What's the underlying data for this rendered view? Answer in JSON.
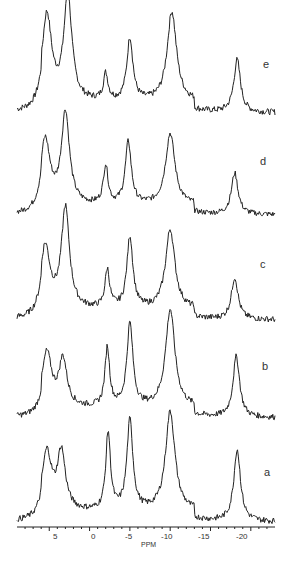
{
  "chart_data": {
    "type": "line",
    "title": "",
    "xlabel": "PPM",
    "ylabel": "",
    "xlim": [
      9,
      -23
    ],
    "x_reversed": true,
    "x_ticks": [
      5,
      0,
      -5,
      -10,
      -15,
      -20
    ],
    "x_tick_labels": [
      "5",
      "0",
      "-5",
      "-10",
      "-15",
      "-20"
    ],
    "grid": false,
    "legend": "none; traces labelled on right",
    "series": [
      {
        "name": "e",
        "peaks_ppm": [
          5.3,
          2.7,
          -2.0,
          -5.0,
          -10.2,
          -18.3
        ],
        "peak_rel_heights": [
          0.82,
          1.0,
          0.25,
          0.6,
          0.86,
          0.5
        ]
      },
      {
        "name": "d",
        "peaks_ppm": [
          5.5,
          3.0,
          -2.0,
          -4.8,
          -10.0,
          -18.0
        ],
        "peak_rel_heights": [
          0.7,
          1.0,
          0.42,
          0.68,
          0.78,
          0.45
        ]
      },
      {
        "name": "c",
        "peaks_ppm": [
          5.5,
          3.0,
          -2.2,
          -5.0,
          -10.0,
          -18.0
        ],
        "peak_rel_heights": [
          0.62,
          1.0,
          0.38,
          0.72,
          0.8,
          0.42
        ]
      },
      {
        "name": "b",
        "peaks_ppm": [
          5.3,
          3.3,
          -2.2,
          -5.0,
          -10.0,
          -18.2
        ],
        "peak_rel_heights": [
          0.55,
          0.48,
          0.6,
          0.85,
          1.0,
          0.62
        ]
      },
      {
        "name": "a",
        "peaks_ppm": [
          5.3,
          3.5,
          -2.3,
          -5.0,
          -10.0,
          -18.3
        ],
        "peak_rel_heights": [
          0.58,
          0.58,
          0.78,
          0.9,
          1.0,
          0.72
        ]
      }
    ]
  },
  "labels": {
    "e": "e",
    "d": "d",
    "c": "c",
    "b": "b",
    "a": "a",
    "axis": "PPM"
  },
  "ticks": {
    "t5": "5",
    "t0": "0",
    "tm5": "-5",
    "tm10": "-10",
    "tm15": "-15",
    "tm20": "-20"
  }
}
